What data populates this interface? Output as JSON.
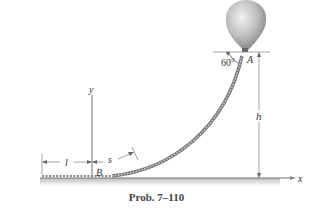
{
  "figure": {
    "caption": "Prob. 7–110",
    "labels": {
      "A": "A",
      "B": "B",
      "x_axis": "x",
      "y_axis": "y",
      "h": "h",
      "l": "l",
      "s": "s",
      "angle": "60°"
    },
    "objects": [
      "balloon",
      "cable",
      "ground"
    ],
    "colors": {
      "balloon": "#b8b8b8",
      "cable": "#9a9a9a",
      "ground": "#888888",
      "text": "#333333"
    }
  }
}
